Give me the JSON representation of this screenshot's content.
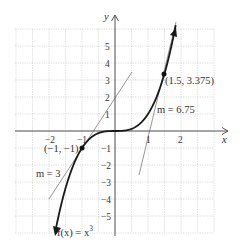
{
  "chart_data": {
    "type": "line",
    "title": "",
    "function_label": "f(x) = x³",
    "xlabel": "x",
    "ylabel": "y",
    "xlim": [
      -3,
      3
    ],
    "ylim": [
      -6,
      6
    ],
    "grid": true,
    "x_ticks": [
      "-2",
      "-1",
      "1",
      "2"
    ],
    "y_ticks": [
      "5",
      "4",
      "3",
      "2",
      "1",
      "-1",
      "-2",
      "-3",
      "-4",
      "-5"
    ],
    "series": [
      {
        "name": "f(x) = x^3",
        "kind": "curve",
        "color": "#1a1a1a"
      },
      {
        "name": "tangent m = 3",
        "kind": "line",
        "slope": 3,
        "through": [
          -1,
          -1
        ],
        "color": "#888888"
      },
      {
        "name": "tangent m = 6.75",
        "kind": "line",
        "slope": 6.75,
        "through": [
          1.5,
          3.375
        ],
        "color": "#888888"
      }
    ],
    "points": [
      {
        "x": -1,
        "y": -1,
        "label": "(−1, −1)"
      },
      {
        "x": 1.5,
        "y": 3.375,
        "label": "(1.5, 3.375)"
      }
    ],
    "annotations": [
      {
        "text": "m = 3",
        "near": [
          -2.1,
          -1.8
        ]
      },
      {
        "text": "m = 6.75",
        "near": [
          1.75,
          1.1
        ]
      }
    ]
  },
  "labels": {
    "x_axis": "x",
    "y_axis": "y",
    "func": "f(x) = x",
    "func_exp": "3",
    "pt1": "(−1, −1)",
    "pt2": "(1.5, 3.375)",
    "m1": "m = 3",
    "m2": "m = 6.75",
    "xt": [
      "−2",
      "−1",
      "1",
      "2"
    ],
    "yt": [
      "5",
      "4",
      "3",
      "2",
      "1",
      "−1",
      "−2",
      "−3",
      "−4",
      "−5"
    ]
  }
}
